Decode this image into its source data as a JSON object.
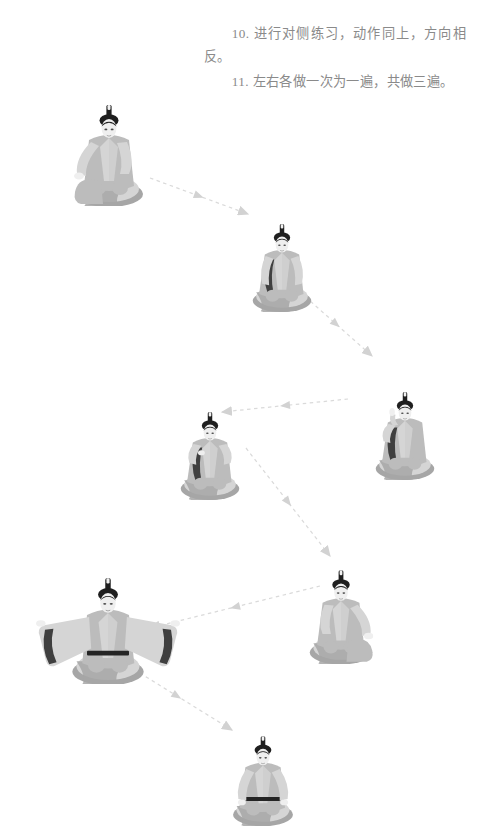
{
  "page": {
    "width": 489,
    "height": 833,
    "background": "#ffffff",
    "kind": "exercise-instruction-illustration"
  },
  "instructions": {
    "paragraph_1": "10. 进行对侧练习，动作同上，方向相反。",
    "paragraph_2": "11. 左右各做一次为一遍，共做三遍。",
    "text_color": "#8a8a8a"
  },
  "colors": {
    "robe_light": "#d5d5d5",
    "robe_mid": "#bcbcbc",
    "robe_shadow": "#a6a6a6",
    "skin": "#efefef",
    "hair_dark": "#1f1f1f",
    "sash_dark": "#242424",
    "arrow": "#d8d8d8",
    "ground_shadow": "#c9c9c9"
  },
  "figures": [
    {
      "id": "figure-1",
      "label": "seated-figure-knee-raised-left",
      "pose": "坐姿，左膝立起，右手扶膝",
      "x": 18,
      "y": 16,
      "width": 170,
      "height": 190,
      "scale": 1.0,
      "arms": "one-hand-on-raised-knee",
      "sash": false
    },
    {
      "id": "figure-2",
      "label": "kneeling-figure-arms-down",
      "pose": "跪坐，双臂自然下垂",
      "x": 222,
      "y": 152,
      "width": 120,
      "height": 160,
      "scale": 0.86,
      "arms": "down",
      "sash": false
    },
    {
      "id": "figure-3",
      "label": "kneeling-figure-hand-raised",
      "pose": "跪坐，右手举至面前",
      "x": 345,
      "y": 318,
      "width": 120,
      "height": 162,
      "scale": 0.86,
      "arms": "right-hand-raised",
      "sash": false
    },
    {
      "id": "figure-4",
      "label": "kneeling-figure-hands-at-chest",
      "pose": "跪坐，双手合于胸前",
      "x": 150,
      "y": 338,
      "width": 120,
      "height": 162,
      "scale": 0.86,
      "arms": "hands-at-chest",
      "sash": false
    },
    {
      "id": "figure-5",
      "label": "seated-figure-arms-outstretched",
      "pose": "盘坐，双臂向两侧平展，宽袖展开",
      "x": 18,
      "y": 512,
      "width": 180,
      "height": 172,
      "scale": 1.05,
      "arms": "outstretched-horizontal",
      "sash": true
    },
    {
      "id": "figure-6",
      "label": "seated-figure-knee-raised-right",
      "pose": "坐姿，右膝立起，左手扶膝",
      "x": 275,
      "y": 502,
      "width": 140,
      "height": 162,
      "scale": 0.92,
      "arms": "one-hand-on-raised-knee-mirrored",
      "sash": false
    },
    {
      "id": "figure-7",
      "label": "seated-figure-hands-on-knees",
      "pose": "盘坐，双手置于膝上，系腰带",
      "x": 198,
      "y": 668,
      "width": 130,
      "height": 158,
      "scale": 0.88,
      "arms": "hands-on-knees",
      "sash": true
    }
  ],
  "arrows": [
    {
      "id": "arrow-1-2",
      "from": "figure-1",
      "to": "figure-2",
      "x1": 150,
      "y1": 178,
      "x2": 248,
      "y2": 214,
      "direction": "down-right"
    },
    {
      "id": "arrow-2-3",
      "from": "figure-2",
      "to": "figure-3",
      "x1": 300,
      "y1": 292,
      "x2": 372,
      "y2": 356,
      "direction": "down-right"
    },
    {
      "id": "arrow-3-4",
      "from": "figure-3",
      "to": "figure-4",
      "x1": 348,
      "y1": 399,
      "x2": 222,
      "y2": 412,
      "direction": "left"
    },
    {
      "id": "arrow-4-6",
      "from": "figure-4",
      "to": "figure-6",
      "x1": 246,
      "y1": 448,
      "x2": 330,
      "y2": 556,
      "direction": "down-right"
    },
    {
      "id": "arrow-6-5",
      "from": "figure-6",
      "to": "figure-5",
      "x1": 320,
      "y1": 586,
      "x2": 150,
      "y2": 628,
      "direction": "down-left"
    },
    {
      "id": "arrow-5-7",
      "from": "figure-5",
      "to": "figure-7",
      "x1": 122,
      "y1": 662,
      "x2": 232,
      "y2": 730,
      "direction": "down-right"
    }
  ]
}
